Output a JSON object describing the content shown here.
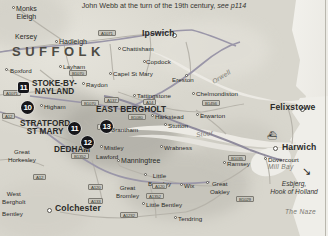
{
  "map": {
    "caption_main": "John Webb at the turn of the 19th century,",
    "caption_ref": "see p114",
    "region_label": "SUFFOLK",
    "width": 328,
    "height": 236,
    "colors": {
      "land": "#dedcd3",
      "water": "#eceae4",
      "road_primary": "#8f8b9c",
      "road_secondary": "#c2bfb6",
      "marker_fill": "#16161a",
      "marker_text": "#ffffff",
      "label_text": "#2a2a28",
      "water_label": "#7b7971"
    },
    "numbered_markers": [
      {
        "id": "marker-11-sq",
        "label": "11",
        "shape": "square",
        "x": 18,
        "y": 82,
        "place": "Stoke-by-Nayland"
      },
      {
        "id": "marker-10",
        "label": "10",
        "shape": "circle",
        "x": 21,
        "y": 101,
        "place": "near Higham"
      },
      {
        "id": "marker-11",
        "label": "11",
        "shape": "circle",
        "x": 68,
        "y": 122,
        "place": "Stratford St Mary"
      },
      {
        "id": "marker-12",
        "label": "12",
        "shape": "circle",
        "x": 81,
        "y": 136,
        "place": "Dedham"
      },
      {
        "id": "marker-13",
        "label": "13",
        "shape": "circle",
        "x": 100,
        "y": 120,
        "place": "East Bergholt"
      }
    ],
    "places": [
      {
        "name": "Monks\nEleigh",
        "x": 16,
        "y": 5,
        "style": "town",
        "dot": true,
        "dot_x": 12,
        "dot_y": 6
      },
      {
        "name": "Kersey",
        "x": 15,
        "y": 33,
        "style": "town",
        "dot": false
      },
      {
        "name": "Hadleigh",
        "x": 59,
        "y": 38,
        "style": "town",
        "dot": true,
        "dot_x": 55,
        "dot_y": 40
      },
      {
        "name": "Layham",
        "x": 63,
        "y": 63,
        "style": "small",
        "dot": true,
        "dot_x": 59,
        "dot_y": 65
      },
      {
        "name": "Boxford",
        "x": 10,
        "y": 67,
        "style": "small",
        "dot": true,
        "dot_x": 5,
        "dot_y": 68
      },
      {
        "name": "Raydon",
        "x": 86,
        "y": 81,
        "style": "small",
        "dot": true,
        "dot_x": 82,
        "dot_y": 82
      },
      {
        "name": "Higham",
        "x": 44,
        "y": 103,
        "style": "small",
        "dot": true,
        "dot_x": 40,
        "dot_y": 104
      },
      {
        "name": "STOKE-BY-\nNAYLAND",
        "x": 32,
        "y": 80,
        "style": "major",
        "dot": false
      },
      {
        "name": "STRATFORD\nST MARY",
        "x": 20,
        "y": 120,
        "style": "major",
        "dot": false
      },
      {
        "name": "EAST BERGHOLT",
        "x": 96,
        "y": 106,
        "style": "major",
        "dot": false
      },
      {
        "name": "DEDHAM",
        "x": 54,
        "y": 146,
        "style": "major",
        "dot": false
      },
      {
        "name": "Ipswich",
        "x": 142,
        "y": 30,
        "style": "city",
        "dot": true,
        "dot_x": 172,
        "dot_y": 33
      },
      {
        "name": "Chattisham",
        "x": 122,
        "y": 45,
        "style": "small",
        "dot": true,
        "dot_x": 118,
        "dot_y": 47
      },
      {
        "name": "Capel St Mary",
        "x": 113,
        "y": 70,
        "style": "small",
        "dot": true,
        "dot_x": 109,
        "dot_y": 72
      },
      {
        "name": "Copdock",
        "x": 146,
        "y": 58,
        "style": "small",
        "dot": true,
        "dot_x": 143,
        "dot_y": 60
      },
      {
        "name": "Ereston",
        "x": 172,
        "y": 76,
        "style": "small",
        "dot": true,
        "dot_x": 185,
        "dot_y": 74
      },
      {
        "name": "Tattingstone",
        "x": 137,
        "y": 92,
        "style": "small",
        "dot": true,
        "dot_x": 133,
        "dot_y": 94
      },
      {
        "name": "Chelmondiston",
        "x": 196,
        "y": 90,
        "style": "small",
        "dot": true,
        "dot_x": 192,
        "dot_y": 92
      },
      {
        "name": "Harkstead",
        "x": 155,
        "y": 113,
        "style": "small",
        "dot": true,
        "dot_x": 151,
        "dot_y": 114
      },
      {
        "name": "Erwarton",
        "x": 200,
        "y": 112,
        "style": "small",
        "dot": true,
        "dot_x": 196,
        "dot_y": 113
      },
      {
        "name": "Stutton",
        "x": 168,
        "y": 122,
        "style": "small",
        "dot": true,
        "dot_x": 164,
        "dot_y": 123
      },
      {
        "name": "Felixstowe",
        "x": 270,
        "y": 104,
        "style": "city",
        "dot": true,
        "dot_x": 300,
        "dot_y": 107
      },
      {
        "name": "Harwich",
        "x": 282,
        "y": 144,
        "style": "city",
        "dot": true,
        "dot_x": 273,
        "dot_y": 146
      },
      {
        "name": "Dovercourt",
        "x": 268,
        "y": 156,
        "style": "small",
        "dot": true,
        "dot_x": 264,
        "dot_y": 157
      },
      {
        "name": "Brantham",
        "x": 111,
        "y": 126,
        "style": "small",
        "dot": true,
        "dot_x": 107,
        "dot_y": 127
      },
      {
        "name": "Mistley",
        "x": 104,
        "y": 144,
        "style": "small",
        "dot": true,
        "dot_x": 100,
        "dot_y": 145
      },
      {
        "name": "Manningtree",
        "x": 121,
        "y": 157,
        "style": "town",
        "dot": true,
        "dot_x": 117,
        "dot_y": 159
      },
      {
        "name": "Lawford",
        "x": 96,
        "y": 153,
        "style": "small",
        "dot": false
      },
      {
        "name": "Wrabness",
        "x": 164,
        "y": 144,
        "style": "small",
        "dot": true,
        "dot_x": 160,
        "dot_y": 145
      },
      {
        "name": "Ramsey",
        "x": 227,
        "y": 160,
        "style": "small",
        "dot": true,
        "dot_x": 223,
        "dot_y": 161
      },
      {
        "name": "Great\nHorkesley",
        "x": 8,
        "y": 148,
        "style": "small",
        "dot": false
      },
      {
        "name": "West\nBergholt",
        "x": 2,
        "y": 190,
        "style": "small",
        "dot": false
      },
      {
        "name": "Colchester",
        "x": 55,
        "y": 205,
        "style": "city",
        "dot": true,
        "dot_x": 47,
        "dot_y": 208
      },
      {
        "name": "Little\nBromley",
        "x": 148,
        "y": 172,
        "style": "small",
        "dot": true,
        "dot_x": 144,
        "dot_y": 173
      },
      {
        "name": "Great\nBromley",
        "x": 116,
        "y": 184,
        "style": "small",
        "dot": false
      },
      {
        "name": "Wix",
        "x": 184,
        "y": 182,
        "style": "small",
        "dot": true,
        "dot_x": 180,
        "dot_y": 183
      },
      {
        "name": "Great\nOakley",
        "x": 210,
        "y": 180,
        "style": "small",
        "dot": true,
        "dot_x": 206,
        "dot_y": 181
      },
      {
        "name": "Little Bentley",
        "x": 146,
        "y": 201,
        "style": "small",
        "dot": true,
        "dot_x": 142,
        "dot_y": 202
      },
      {
        "name": "Tendring",
        "x": 178,
        "y": 215,
        "style": "small",
        "dot": true,
        "dot_x": 174,
        "dot_y": 216
      },
      {
        "name": "Bentley",
        "x": 2,
        "y": 210,
        "style": "small",
        "dot": false
      }
    ],
    "water_labels": [
      {
        "name": "Orwell",
        "x": 211,
        "y": 73,
        "rotate": -32
      },
      {
        "name": "Stour",
        "x": 196,
        "y": 130,
        "rotate": -8
      },
      {
        "name": "Mill Bay",
        "x": 268,
        "y": 163,
        "rotate": 0
      },
      {
        "name": "The Naze",
        "x": 285,
        "y": 208,
        "rotate": 0
      }
    ],
    "ferry": {
      "destinations": "Esbjerg,\nHook of Holland",
      "x": 262,
      "y": 180,
      "arrow_x": 302,
      "arrow_y": 166,
      "boat_icon": "ferry-boat-icon",
      "boat_x": 267,
      "boat_y": 132
    },
    "road_shields": [
      {
        "label": "A1071",
        "x": 98,
        "y": 30,
        "kind": "primary"
      },
      {
        "label": "B1070",
        "x": 69,
        "y": 70,
        "kind": "primary"
      },
      {
        "label": "A1071",
        "x": 3,
        "y": 90,
        "kind": "primary"
      },
      {
        "label": "A12",
        "x": 2,
        "y": 113,
        "kind": "primary"
      },
      {
        "label": "B1070",
        "x": 81,
        "y": 100,
        "kind": "primary"
      },
      {
        "label": "A137",
        "x": 104,
        "y": 97,
        "kind": "primary"
      },
      {
        "label": "A14",
        "x": 143,
        "y": 99,
        "kind": "primary"
      },
      {
        "label": "B1456",
        "x": 202,
        "y": 100,
        "kind": "primary"
      },
      {
        "label": "B1080",
        "x": 128,
        "y": 114,
        "kind": "primary"
      },
      {
        "label": "A137",
        "x": 97,
        "y": 124,
        "kind": "primary"
      },
      {
        "label": "A12",
        "x": 33,
        "y": 174,
        "kind": "primary"
      },
      {
        "label": "A120",
        "x": 88,
        "y": 184,
        "kind": "primary"
      },
      {
        "label": "A133",
        "x": 88,
        "y": 198,
        "kind": "primary"
      },
      {
        "label": "A120",
        "x": 152,
        "y": 183,
        "kind": "primary"
      },
      {
        "label": "A1352",
        "x": 146,
        "y": 193,
        "kind": "primary"
      },
      {
        "label": "B1035",
        "x": 228,
        "y": 155,
        "kind": "primary"
      },
      {
        "label": "B1352",
        "x": 71,
        "y": 153,
        "kind": "primary"
      },
      {
        "label": "A1232",
        "x": 120,
        "y": 212,
        "kind": "primary"
      },
      {
        "label": "B1029",
        "x": 236,
        "y": 196,
        "kind": "primary"
      }
    ]
  }
}
